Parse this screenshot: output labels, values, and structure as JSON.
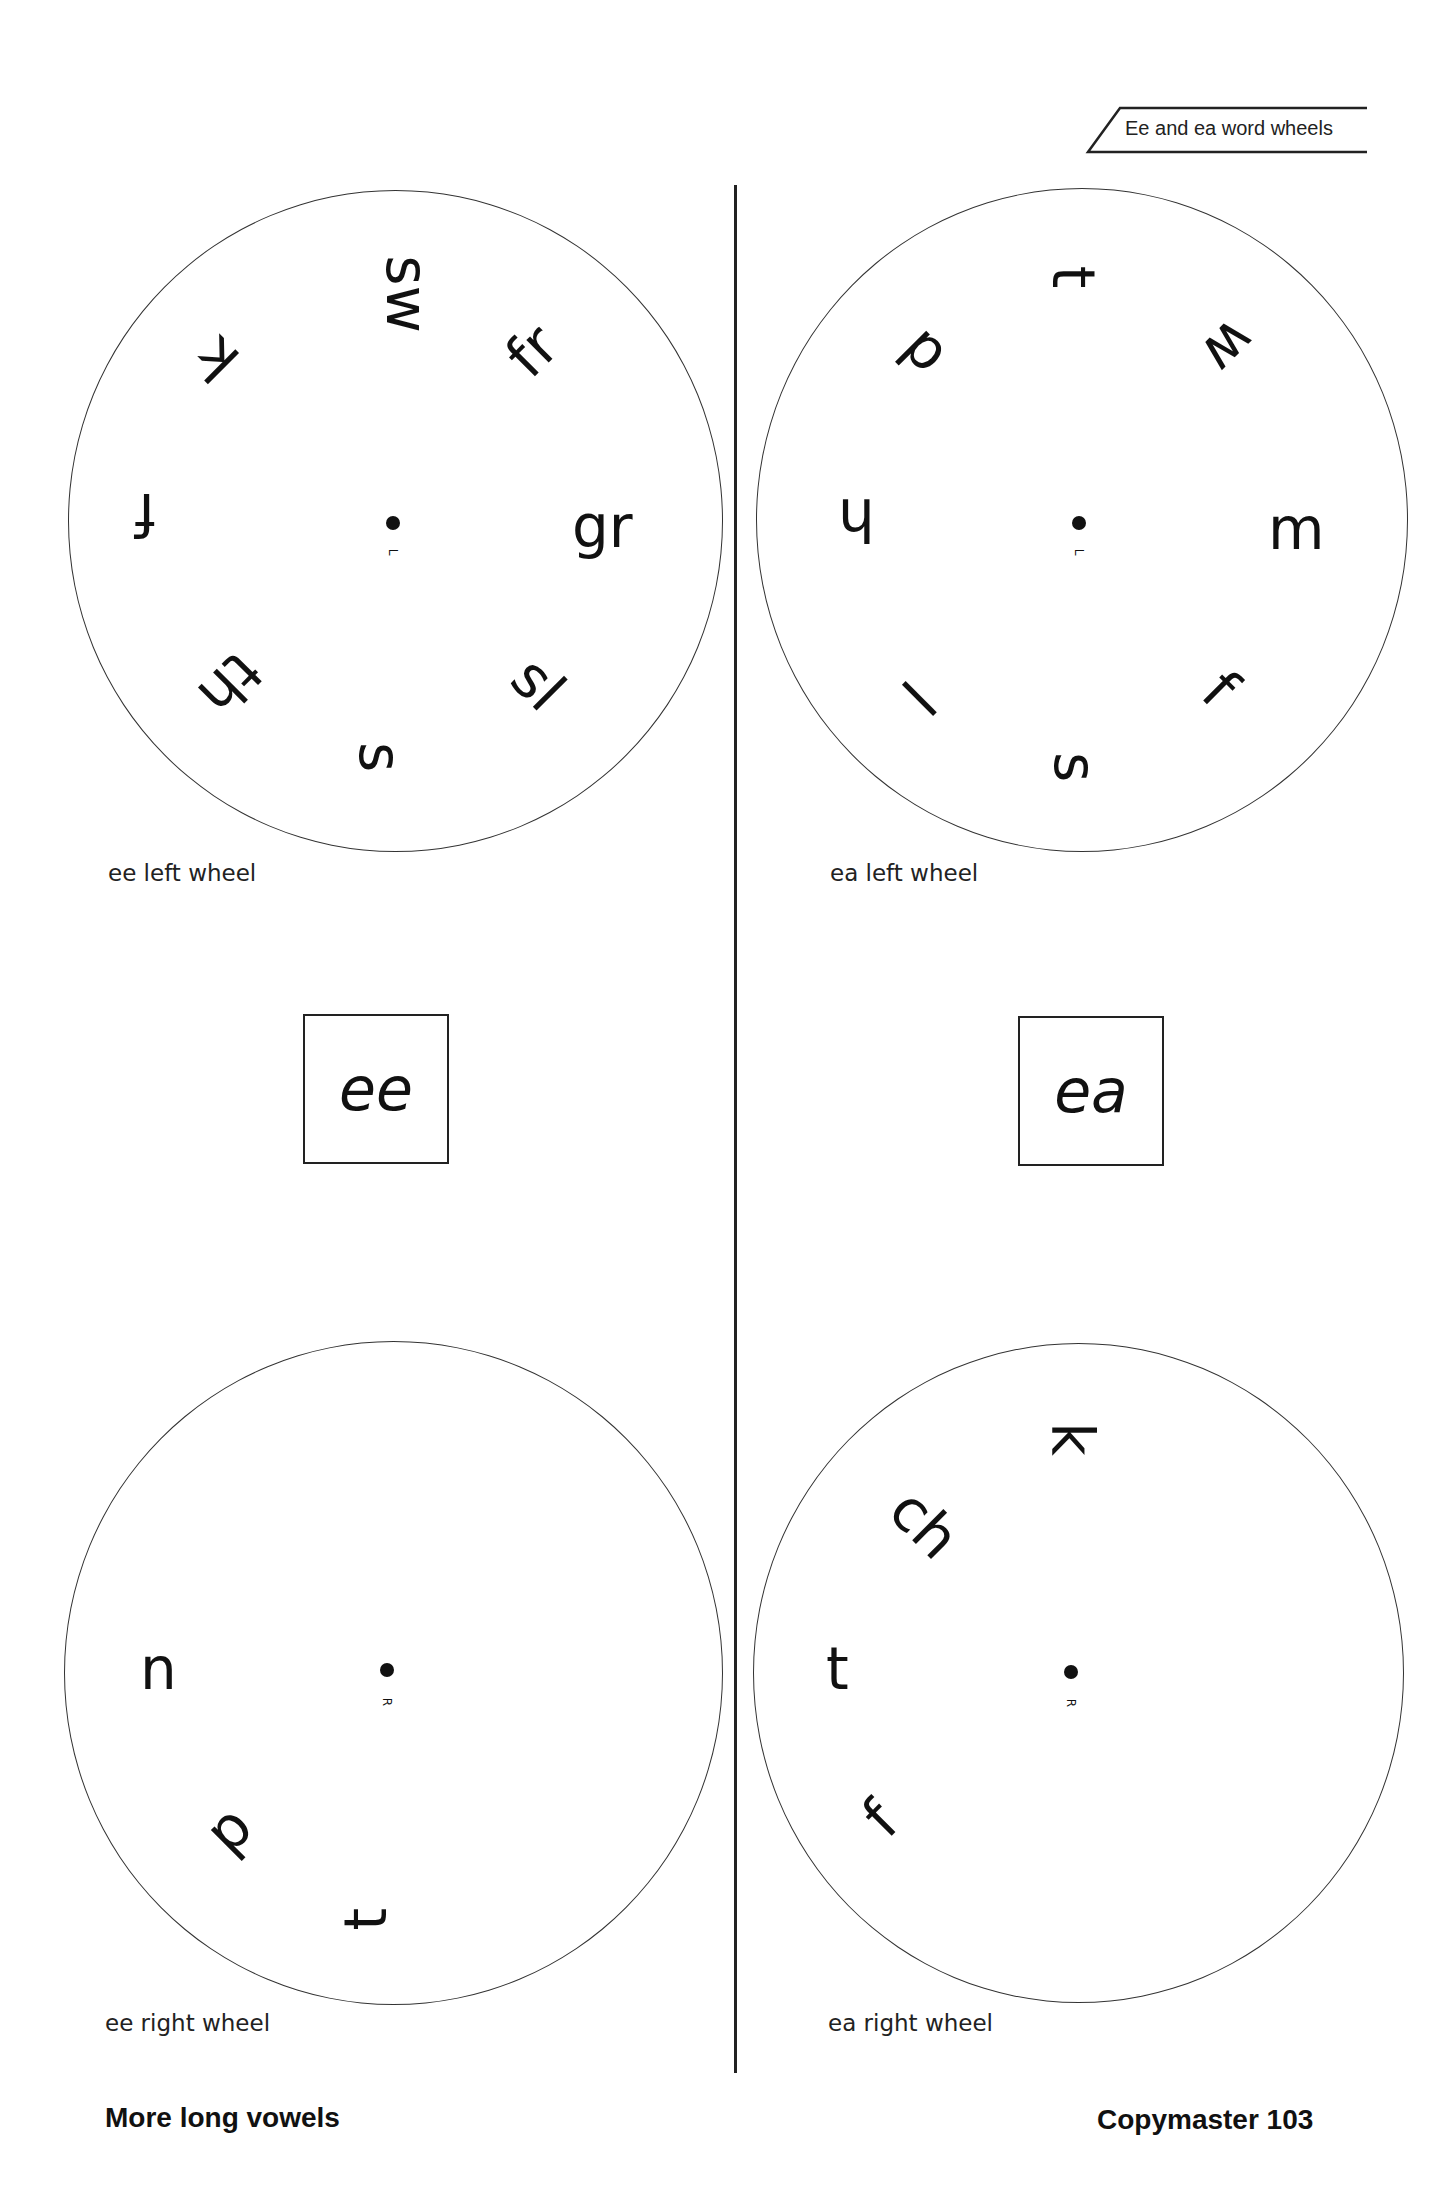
{
  "header": {
    "title": "Ee and ea word wheels"
  },
  "wheels": {
    "ee_left": {
      "label": "ee left wheel",
      "center_mark": "L",
      "onsets": [
        "sw",
        "fr",
        "gr",
        "sl",
        "s",
        "th",
        "f",
        "k"
      ]
    },
    "ea_left": {
      "label": "ea left wheel",
      "center_mark": "L",
      "onsets": [
        "t",
        "w",
        "m",
        "f",
        "s",
        "l",
        "h",
        "d"
      ]
    },
    "ee_right": {
      "label": "ee right wheel",
      "center_mark": "R",
      "endings": [
        "n",
        "p",
        "t"
      ]
    },
    "ea_right": {
      "label": "ea right wheel",
      "center_mark": "R",
      "endings": [
        "k",
        "ch",
        "t",
        "f"
      ]
    }
  },
  "vowel_boxes": {
    "ee": "ee",
    "ea": "ea"
  },
  "footer": {
    "section": "More long vowels",
    "page": "Copymaster  103"
  }
}
